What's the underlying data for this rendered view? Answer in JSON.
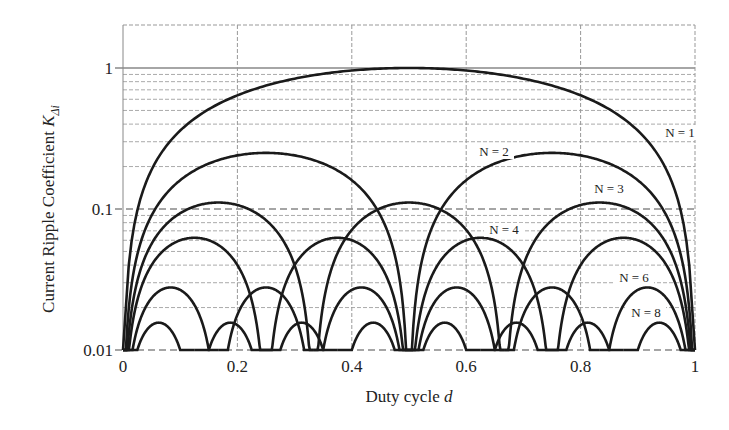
{
  "chart_data": {
    "type": "line",
    "title": "",
    "xlabel": "Duty cycle d",
    "ylabel": "Current Ripple Coefficient K_Δi",
    "xlabel_main": "Duty cycle ",
    "xlabel_var": "d",
    "ylabel_main": "Current Ripple Coefficient ",
    "ylabel_var": "K",
    "ylabel_sub": "Δi",
    "xlim": [
      0,
      1
    ],
    "ylim": [
      0.01,
      3
    ],
    "yscale": "log",
    "grid": true,
    "x_ticks": [
      "0",
      "0.2",
      "0.4",
      "0.6",
      "0.8",
      "1"
    ],
    "x_tick_values": [
      0,
      0.2,
      0.4,
      0.6,
      0.8,
      1
    ],
    "y_ticks": [
      "0.01",
      "0.1",
      "1"
    ],
    "y_tick_values": [
      0.01,
      0.1,
      1
    ],
    "formula": "K = 4(N·d − m)(m + 1 − N·d) / N², m = floor(N·d)",
    "series": [
      {
        "name": "N = 1",
        "N": 1,
        "peak": 1.0,
        "peak_at": [
          0.5
        ]
      },
      {
        "name": "N = 2",
        "N": 2,
        "peak": 0.25,
        "peak_at": [
          0.25,
          0.75
        ]
      },
      {
        "name": "N = 3",
        "N": 3,
        "peak": 0.111,
        "peak_at": [
          0.167,
          0.5,
          0.833
        ]
      },
      {
        "name": "N = 4",
        "N": 4,
        "peak": 0.0625,
        "peak_at": [
          0.125,
          0.375,
          0.625,
          0.875
        ]
      },
      {
        "name": "N = 6",
        "N": 6,
        "peak": 0.0278,
        "peak_at": [
          0.083,
          0.25,
          0.417,
          0.583,
          0.75,
          0.917
        ]
      },
      {
        "name": "N = 8",
        "N": 8,
        "peak": 0.0156,
        "peak_at": [
          0.0625,
          0.1875,
          0.3125,
          0.4375,
          0.5625,
          0.6875,
          0.8125,
          0.9375
        ]
      }
    ],
    "annotations": [
      {
        "text": "N = 1",
        "x": 680,
        "y": 137
      },
      {
        "text": "N = 2",
        "x": 494,
        "y": 156
      },
      {
        "text": "N = 3",
        "x": 609,
        "y": 193
      },
      {
        "text": "N = 4",
        "x": 504,
        "y": 234
      },
      {
        "text": "N = 6",
        "x": 634,
        "y": 282
      },
      {
        "text": "N = 8",
        "x": 646,
        "y": 317
      }
    ]
  }
}
